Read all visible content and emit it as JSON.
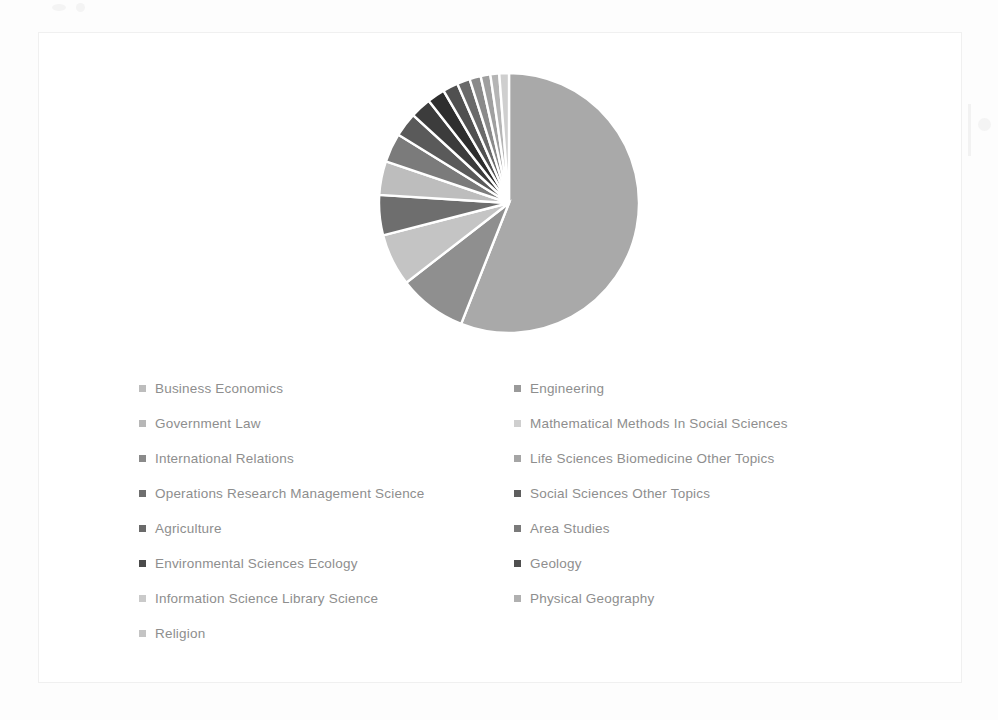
{
  "chart_data": {
    "type": "pie",
    "title": "",
    "subtitle": "",
    "xlabel": "",
    "ylabel": "",
    "grid": false,
    "legend_position": "bottom",
    "legend_columns": 2,
    "start_angle_deg": 0,
    "direction": "clockwise",
    "categories": [
      "Business Economics",
      "Engineering",
      "Government Law",
      "Mathematical Methods In Social Sciences",
      "International Relations",
      "Life Sciences Biomedicine Other Topics",
      "Operations Research Management Science",
      "Social Sciences Other Topics",
      "Agriculture",
      "Area Studies",
      "Environmental Sciences Ecology",
      "Geology",
      "Information Science Library Science",
      "Physical Geography",
      "Religion"
    ],
    "values": [
      56.0,
      8.5,
      6.5,
      5.0,
      4.2,
      3.6,
      3.0,
      2.6,
      2.2,
      1.9,
      1.6,
      1.4,
      1.2,
      1.1,
      1.2
    ],
    "slice_colors": [
      "#a9a9a9",
      "#8f8f8f",
      "#c4c4c4",
      "#6e6e6e",
      "#bdbdbd",
      "#7b7b7b",
      "#5a5a5a",
      "#3c3c3c",
      "#2e2e2e",
      "#505050",
      "#6a6a6a",
      "#8a8a8a",
      "#9f9f9f",
      "#b5b5b5",
      "#cfcfcf"
    ],
    "units": "%"
  },
  "legend": {
    "columns": [
      {
        "name": "left-column",
        "items": [
          {
            "label": "Business Economics",
            "color": "#bdbdbd"
          },
          {
            "label": "Government Law",
            "color": "#b7b7b7"
          },
          {
            "label": "International Relations",
            "color": "#8a8a8a"
          },
          {
            "label": "Operations Research Management Science",
            "color": "#6e6e6e"
          },
          {
            "label": "Agriculture",
            "color": "#6a6a6a"
          },
          {
            "label": "Environmental Sciences Ecology",
            "color": "#4a4a4a"
          },
          {
            "label": "Information Science Library Science",
            "color": "#cacaca"
          },
          {
            "label": "Religion",
            "color": "#c4c4c4"
          }
        ]
      },
      {
        "name": "right-column",
        "items": [
          {
            "label": "Engineering",
            "color": "#9a9a9a"
          },
          {
            "label": "Mathematical Methods In Social Sciences",
            "color": "#cfcfcf"
          },
          {
            "label": "Life Sciences Biomedicine Other Topics",
            "color": "#a5a5a5"
          },
          {
            "label": "Social Sciences Other Topics",
            "color": "#5e5e5e"
          },
          {
            "label": "Area Studies",
            "color": "#7a7a7a"
          },
          {
            "label": "Geology",
            "color": "#4f4f4f"
          },
          {
            "label": "Physical Geography",
            "color": "#b0b0b0"
          }
        ]
      }
    ]
  },
  "style": {
    "page_background": "#fdfdfd",
    "frame_background": "#ffffff",
    "frame_border": "#f0f0f0",
    "legend_text_color": "#8e8e8e",
    "slice_separator": "#ffffff"
  }
}
